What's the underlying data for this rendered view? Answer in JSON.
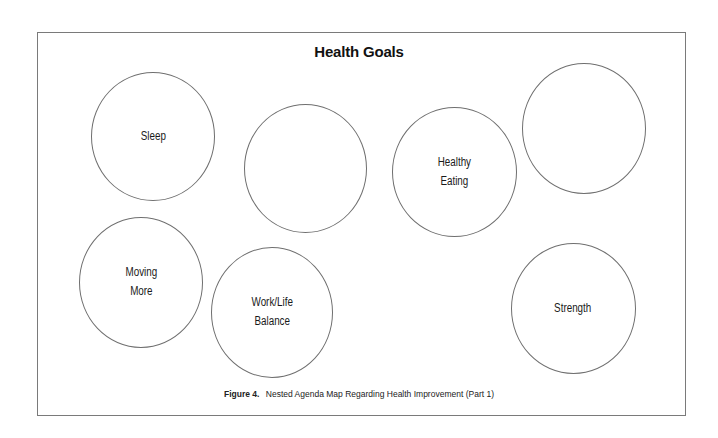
{
  "diagram": {
    "title": "Health Goals",
    "caption": {
      "figure_label": "Figure 4.",
      "text": "Nested Agenda Map Regarding Health Improvement (Part 1)"
    },
    "nodes": [
      {
        "label": "Sleep",
        "cx": 153,
        "cy": 136,
        "w": 124,
        "h": 129
      },
      {
        "label": "",
        "cx": 305,
        "cy": 168,
        "w": 123,
        "h": 129
      },
      {
        "label": "Healthy\nEating",
        "cx": 454,
        "cy": 172,
        "w": 125,
        "h": 130
      },
      {
        "label": "",
        "cx": 584,
        "cy": 128,
        "w": 124,
        "h": 131
      },
      {
        "label": "Moving\nMore",
        "cx": 141,
        "cy": 282,
        "w": 124,
        "h": 131
      },
      {
        "label": "Work/Life\nBalance",
        "cx": 272,
        "cy": 312,
        "w": 122,
        "h": 131
      },
      {
        "label": "Strength",
        "cx": 573,
        "cy": 308,
        "w": 125,
        "h": 131
      }
    ]
  },
  "colors": {
    "border": "#7a7a7a",
    "circle_stroke": "#6f6f6f",
    "text": "#1a1a1a",
    "background": "#ffffff"
  }
}
